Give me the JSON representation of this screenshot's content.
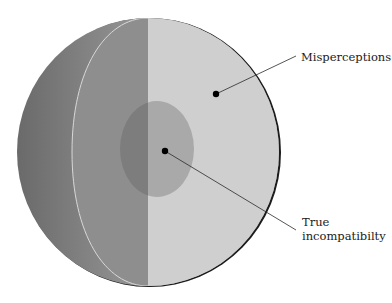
{
  "diagram": {
    "type": "sphere-cutaway",
    "colors": {
      "background": "#ffffff",
      "outer_shell_dark": "#6e6e6e",
      "outer_shell_light": "#a8a8a8",
      "left_half_face": "#8e8e8e",
      "right_half_face": "#cfcfcf",
      "core_left": "#7d7d7d",
      "core_right": "#a9a9a9",
      "rim": "#1c1c1c",
      "leader_line": "#2a2a2a",
      "dot": "#000000"
    },
    "labels": [
      {
        "id": "misperceptions",
        "lines": [
          "Misperceptions"
        ]
      },
      {
        "id": "true-incompatibility",
        "lines": [
          "True",
          "incompatibilty"
        ]
      }
    ]
  }
}
